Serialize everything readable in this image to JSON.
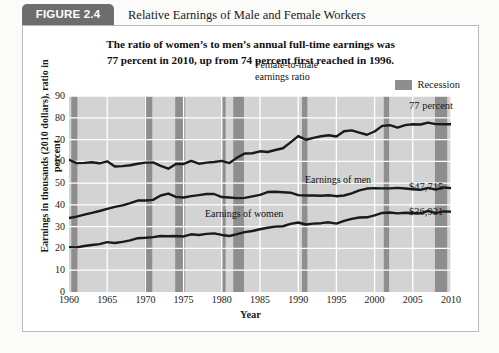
{
  "figure": {
    "badge": "FIGURE 2.4",
    "title": "Relative Earnings of Male and Female Workers",
    "subtitle_line1": "The ratio of women’s to men’s annual full-time earnings was",
    "subtitle_line2": "77 percent in 2010, up from 74 percent first reached in 1996."
  },
  "legend": {
    "recession_label": "Recession",
    "recession_color": "#8e8e8e"
  },
  "annotations": {
    "ratio_end": "77 percent",
    "men_end": "$47,715",
    "women_end": "$36,931",
    "ratio_series_label_line1": "Female-to-male",
    "ratio_series_label_line2": "earnings ratio",
    "men_series_label": "Earnings of men",
    "women_series_label": "Earnings of women"
  },
  "chart_data": {
    "type": "line",
    "title": "Relative Earnings of Male and Female Workers",
    "xlabel": "Year",
    "ylabel": "Earnings in thousands (2010 dollars), ratio in percent",
    "xlim": [
      1960,
      2010
    ],
    "ylim": [
      0,
      90
    ],
    "yticks": [
      0,
      10,
      20,
      30,
      40,
      50,
      60,
      70,
      80,
      90
    ],
    "xticks": [
      1960,
      1965,
      1970,
      1975,
      1980,
      1985,
      1990,
      1995,
      2000,
      2005,
      2010
    ],
    "grid": true,
    "plot_background": "#d3d3d3",
    "gridline_color": "#ffffff",
    "line_color": "#1a1a1a",
    "legend_position": "above-right",
    "x": [
      1960,
      1961,
      1962,
      1963,
      1964,
      1965,
      1966,
      1967,
      1968,
      1969,
      1970,
      1971,
      1972,
      1973,
      1974,
      1975,
      1976,
      1977,
      1978,
      1979,
      1980,
      1981,
      1982,
      1983,
      1984,
      1985,
      1986,
      1987,
      1988,
      1989,
      1990,
      1991,
      1992,
      1993,
      1994,
      1995,
      1996,
      1997,
      1998,
      1999,
      2000,
      2001,
      2002,
      2003,
      2004,
      2005,
      2006,
      2007,
      2008,
      2009,
      2010
    ],
    "series": [
      {
        "name": "Female-to-male earnings ratio",
        "units": "percent",
        "end_value": 77,
        "values": [
          60.7,
          59.2,
          59.3,
          59.6,
          59.1,
          60.0,
          57.6,
          57.8,
          58.2,
          58.9,
          59.4,
          59.5,
          57.9,
          56.6,
          58.8,
          58.8,
          60.2,
          58.9,
          59.4,
          59.7,
          60.2,
          59.2,
          61.7,
          63.6,
          63.7,
          64.6,
          64.3,
          65.2,
          66.0,
          68.7,
          71.6,
          69.9,
          70.8,
          71.5,
          72.0,
          71.4,
          73.8,
          74.2,
          73.2,
          72.2,
          73.7,
          76.3,
          76.6,
          75.5,
          76.6,
          77.0,
          76.9,
          77.8,
          77.1,
          77.0,
          77.0
        ]
      },
      {
        "name": "Earnings of men",
        "units": "thousands of 2010 dollars",
        "end_value": 47715,
        "end_value_label": "$47,715",
        "values": [
          34.0,
          34.6,
          35.5,
          36.3,
          37.2,
          38.2,
          39.1,
          39.8,
          40.8,
          42.0,
          42.0,
          42.3,
          44.3,
          45.2,
          43.7,
          43.4,
          44.0,
          44.5,
          45.0,
          45.0,
          43.6,
          43.4,
          43.1,
          43.2,
          43.9,
          44.6,
          45.9,
          46.0,
          45.8,
          45.6,
          44.5,
          44.3,
          44.3,
          44.2,
          44.4,
          44.0,
          44.3,
          45.3,
          46.7,
          47.5,
          47.7,
          47.6,
          47.6,
          47.8,
          47.5,
          47.2,
          46.9,
          47.8,
          47.0,
          48.0,
          47.7
        ]
      },
      {
        "name": "Earnings of women",
        "units": "thousands of 2010 dollars",
        "end_value": 36931,
        "end_value_label": "$36,931",
        "values": [
          20.6,
          20.5,
          21.1,
          21.6,
          22.0,
          22.9,
          22.5,
          23.0,
          23.7,
          24.7,
          24.9,
          25.2,
          25.7,
          25.6,
          25.7,
          25.5,
          26.5,
          26.2,
          26.7,
          26.9,
          26.2,
          25.7,
          26.6,
          27.5,
          28.0,
          28.8,
          29.5,
          30.0,
          30.2,
          31.3,
          31.9,
          31.0,
          31.4,
          31.6,
          32.0,
          31.4,
          32.7,
          33.6,
          34.2,
          34.3,
          35.2,
          36.3,
          36.5,
          36.1,
          36.4,
          36.3,
          36.1,
          37.2,
          36.2,
          37.0,
          36.9
        ]
      }
    ],
    "recessions": [
      {
        "start": 1960.3,
        "end": 1961.1
      },
      {
        "start": 1969.9,
        "end": 1970.9
      },
      {
        "start": 1973.9,
        "end": 1975.2
      },
      {
        "start": 1980.0,
        "end": 1980.5
      },
      {
        "start": 1981.5,
        "end": 1982.9
      },
      {
        "start": 1990.5,
        "end": 1991.2
      },
      {
        "start": 2001.2,
        "end": 2001.9
      },
      {
        "start": 2007.9,
        "end": 2009.5
      }
    ]
  }
}
